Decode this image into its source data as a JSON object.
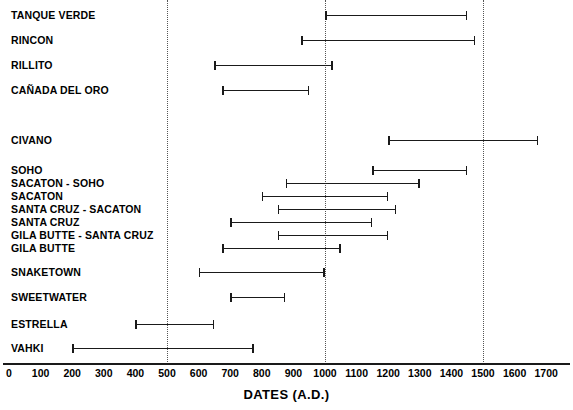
{
  "chart_data": {
    "type": "bar",
    "chart_style": "horizontal-range / gantt chronology",
    "title": "",
    "xlabel": "DATES (A.D.)",
    "ylabel": "",
    "xlim": [
      0,
      1700
    ],
    "xticks": [
      0,
      100,
      200,
      300,
      400,
      500,
      600,
      700,
      800,
      900,
      1000,
      1100,
      1200,
      1300,
      1400,
      1500,
      1600,
      1700
    ],
    "xtick_labels": [
      "0",
      "100",
      "200",
      "300",
      "400",
      "500",
      "600",
      "700",
      "800",
      "900",
      "1000",
      "1100",
      "1200",
      "1300",
      "1400",
      "1500",
      "1600",
      "1700"
    ],
    "grid": true,
    "gridlines_x": [
      500,
      1000,
      1500
    ],
    "legend": null,
    "series_color": "#1a1a1a",
    "categories": [
      "TANQUE VERDE",
      "RINCON",
      "RILLITO",
      "CAÑADA DEL ORO",
      "CIVANO",
      "SOHO",
      "SACATON - SOHO",
      "SACATON",
      "SANTA CRUZ - SACATON",
      "SANTA CRUZ",
      "GILA BUTTE - SANTA CRUZ",
      "GILA BUTTE",
      "SNAKETOWN",
      "SWEETWATER",
      "ESTRELLA",
      "VAHKI"
    ],
    "ranges": [
      {
        "label": "TANQUE VERDE",
        "start": 1000,
        "end": 1450
      },
      {
        "label": "RINCON",
        "start": 925,
        "end": 1475
      },
      {
        "label": "RILLITO",
        "start": 650,
        "end": 1025
      },
      {
        "label": "CAÑADA DEL ORO",
        "start": 675,
        "end": 950
      },
      {
        "label": "CIVANO",
        "start": 1200,
        "end": 1675
      },
      {
        "label": "SOHO",
        "start": 1150,
        "end": 1450
      },
      {
        "label": "SACATON - SOHO",
        "start": 875,
        "end": 1300
      },
      {
        "label": "SACATON",
        "start": 800,
        "end": 1200
      },
      {
        "label": "SANTA CRUZ - SACATON",
        "start": 850,
        "end": 1225
      },
      {
        "label": "SANTA CRUZ",
        "start": 700,
        "end": 1150
      },
      {
        "label": "GILA BUTTE - SANTA CRUZ",
        "start": 850,
        "end": 1200
      },
      {
        "label": "GILA BUTTE",
        "start": 675,
        "end": 1050
      },
      {
        "label": "SNAKETOWN",
        "start": 600,
        "end": 1000
      },
      {
        "label": "SWEETWATER",
        "start": 700,
        "end": 875
      },
      {
        "label": "ESTRELLA",
        "start": 400,
        "end": 650
      },
      {
        "label": "VAHKI",
        "start": 200,
        "end": 775
      }
    ]
  },
  "layout": {
    "row_y": [
      8,
      33,
      58,
      83,
      133,
      163,
      176,
      189,
      202,
      215,
      228,
      241,
      265,
      290,
      317,
      341
    ]
  }
}
